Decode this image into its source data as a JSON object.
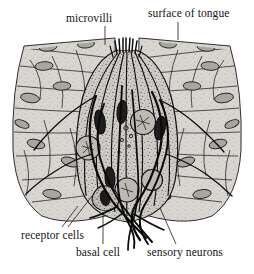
{
  "figure": {
    "style": "stippled black and white anatomical line drawing",
    "background_color": "#ffffff",
    "ink_color": "#141414",
    "cell_fill_color": "#cfcbc6",
    "epithelium_fill_color": "#d7d4cf",
    "nucleus_color": "#2b2b2b"
  },
  "labels": {
    "microvilli": "microvilli",
    "surface_of_tongue": "surface of tongue",
    "receptor_cells": "receptor cells",
    "basal_cell": "basal cell",
    "sensory_neurons": "sensory neurons",
    "caption_partial": ""
  }
}
